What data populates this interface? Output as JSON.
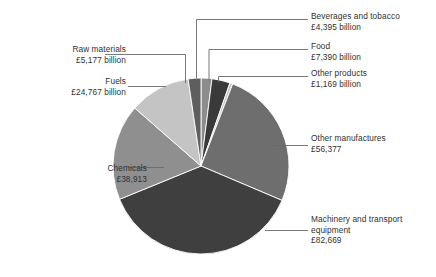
{
  "chart_data": {
    "type": "pie",
    "title": "",
    "currency": "£",
    "unit_note": "billion",
    "total": 220857,
    "start_angle_deg": 0,
    "direction": "clockwise",
    "categories": [
      "Beverages and tobacco",
      "Food",
      "Other products",
      "Other manufactures",
      "Machinery and transport equipment",
      "Chemicals",
      "Fuels",
      "Raw materials"
    ],
    "values": [
      4395,
      7390,
      1169,
      56377,
      82669,
      38913,
      24767,
      5177
    ],
    "colors": [
      "#8c8c8c",
      "#3a3a3a",
      "#c9c9c9",
      "#6e6e6e",
      "#3f3f3f",
      "#8f8f8f",
      "#c4c4c4",
      "#5e5e5e"
    ],
    "slices": [
      {
        "name": "Beverages and tobacco",
        "value": 4395,
        "label_line1": "Beverages and tobacco",
        "label_line2": "£4,395 billion",
        "color": "#8c8c8c"
      },
      {
        "name": "Food",
        "value": 7390,
        "label_line1": "Food",
        "label_line2": "£7,390 billion",
        "color": "#3a3a3a"
      },
      {
        "name": "Other products",
        "value": 1169,
        "label_line1": "Other products",
        "label_line2": "£1,169 billion",
        "color": "#c9c9c9"
      },
      {
        "name": "Other manufactures",
        "value": 56377,
        "label_line1": "Other manufactures",
        "label_line2": "£56,377",
        "color": "#6e6e6e"
      },
      {
        "name": "Machinery and transport equipment",
        "value": 82669,
        "label_line1": "Machinery and transport",
        "label_line2": "equipment",
        "label_line3": "£82,669",
        "color": "#3f3f3f"
      },
      {
        "name": "Chemicals",
        "value": 38913,
        "label_line1": "Chemicals",
        "label_line2": "£38,913",
        "color": "#8f8f8f"
      },
      {
        "name": "Fuels",
        "value": 24767,
        "label_line1": "Fuels",
        "label_line2": "£24,767 billion",
        "color": "#c4c4c4"
      },
      {
        "name": "Raw materials",
        "value": 5177,
        "label_line1": "Raw materials",
        "label_line2": "£5,177 billion",
        "color": "#5e5e5e"
      }
    ],
    "geometry": {
      "cx": 201,
      "cy": 166,
      "r": 88
    },
    "legend": "none",
    "grid": false
  },
  "labels": {
    "beverages": {
      "line1": "Beverages and tobacco",
      "line2": "£4,395 billion"
    },
    "food": {
      "line1": "Food",
      "line2": "£7,390 billion"
    },
    "otherproducts": {
      "line1": "Other products",
      "line2": "£1,169 billion"
    },
    "othermanu": {
      "line1": "Other manufactures",
      "line2": "£56,377"
    },
    "machinery": {
      "line1": "Machinery and transport",
      "line2": "equipment",
      "line3": "£82,669"
    },
    "chemicals": {
      "line1": "Chemicals",
      "line2": "£38,913"
    },
    "fuels": {
      "line1": "Fuels",
      "line2": "£24,767 billion"
    },
    "rawmaterials": {
      "line1": "Raw materials",
      "line2": "£5,177 billion"
    }
  }
}
